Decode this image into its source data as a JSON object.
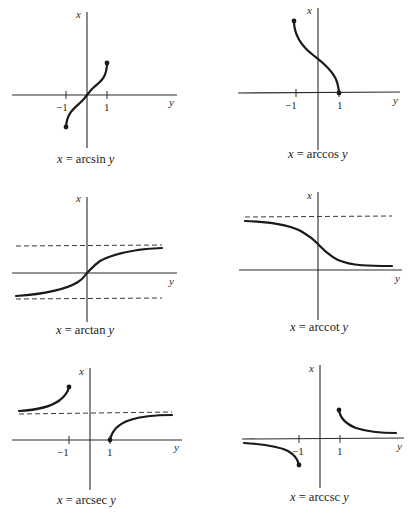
{
  "figure": {
    "axis_labels": {
      "vertical": "x",
      "horizontal": "y"
    },
    "graphs": [
      {
        "id": "arcsin",
        "caption": {
          "var": "x",
          "eq": "= arcsin",
          "arg": "y"
        },
        "ticks": [
          "−1",
          "1"
        ],
        "has_asymptotes": false,
        "endpoints": [
          [
            -1,
            -1.5708
          ],
          [
            1,
            1.5708
          ]
        ]
      },
      {
        "id": "arccos",
        "caption": {
          "var": "x",
          "eq": "= arccos",
          "arg": "y"
        },
        "ticks": [
          "−1",
          "1"
        ],
        "has_asymptotes": false,
        "endpoints": [
          [
            -1,
            3.1416
          ],
          [
            1,
            0
          ]
        ]
      },
      {
        "id": "arctan",
        "caption": {
          "var": "x",
          "eq": "= arctan",
          "arg": "y"
        },
        "ticks": [],
        "has_asymptotes": true,
        "asymptotes": [
          1.5708,
          -1.5708
        ]
      },
      {
        "id": "arccot",
        "caption": {
          "var": "x",
          "eq": "= arccot",
          "arg": "y"
        },
        "ticks": [],
        "has_asymptotes": true,
        "asymptotes": [
          3.1416
        ]
      },
      {
        "id": "arcsec",
        "caption": {
          "var": "x",
          "eq": "= arcsec",
          "arg": "y"
        },
        "ticks": [
          "−1",
          "1"
        ],
        "has_asymptotes": true,
        "asymptotes": [
          1.5708
        ],
        "endpoints": [
          [
            -1,
            3.1416
          ],
          [
            1,
            0
          ]
        ]
      },
      {
        "id": "arccsc",
        "caption": {
          "var": "x",
          "eq": "= arccsc",
          "arg": "y"
        },
        "ticks": [
          "−1",
          "1"
        ],
        "has_asymptotes": false,
        "endpoints": [
          [
            1,
            1.5708
          ],
          [
            -1,
            -1.5708
          ]
        ]
      }
    ]
  }
}
